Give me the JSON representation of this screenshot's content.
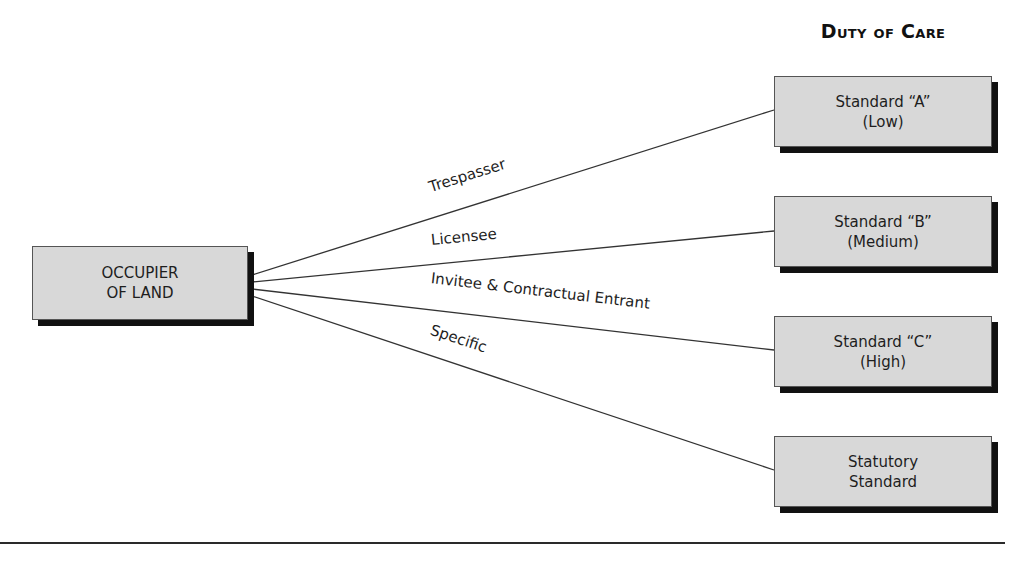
{
  "header": {
    "title": "Duty of Care"
  },
  "source": {
    "label": "OCCUPIER\nOF LAND",
    "x": 32,
    "y": 246,
    "w": 214,
    "h": 72
  },
  "targets": [
    {
      "id": "standard-a",
      "label": "Standard “A”\n(Low)",
      "x": 774,
      "y": 76,
      "w": 216,
      "h": 69
    },
    {
      "id": "standard-b",
      "label": "Standard “B”\n(Medium)",
      "x": 774,
      "y": 196,
      "w": 216,
      "h": 69
    },
    {
      "id": "standard-c",
      "label": "Standard “C”\n(High)",
      "x": 774,
      "y": 316,
      "w": 216,
      "h": 69
    },
    {
      "id": "statutory",
      "label": "Statutory\nStandard",
      "x": 774,
      "y": 436,
      "w": 216,
      "h": 69
    }
  ],
  "edges": [
    {
      "label": "Trespasser",
      "from": [
        252,
        275
      ],
      "to": [
        774,
        110
      ]
    },
    {
      "label": "Licensee",
      "from": [
        252,
        282
      ],
      "to": [
        774,
        231
      ]
    },
    {
      "label": "Invitee & Contractual Entrant",
      "from": [
        252,
        289
      ],
      "to": [
        774,
        350
      ]
    },
    {
      "label": "Specific",
      "from": [
        252,
        296
      ],
      "to": [
        774,
        470
      ]
    }
  ],
  "edge_labels": [
    {
      "text": "Trespasser",
      "x": 432,
      "y": 196,
      "angle": -17.5
    },
    {
      "text": "Licensee",
      "x": 432,
      "y": 249,
      "angle": -5.6
    },
    {
      "text": "Invitee & Contractual Entrant",
      "x": 430,
      "y": 287,
      "angle": 6.7
    },
    {
      "text": "Specific",
      "x": 428,
      "y": 338,
      "angle": 18.4
    }
  ],
  "colors": {
    "box_fill": "#d8d8d8",
    "box_border": "#555555",
    "shadow": "#111111",
    "line": "#333333"
  }
}
